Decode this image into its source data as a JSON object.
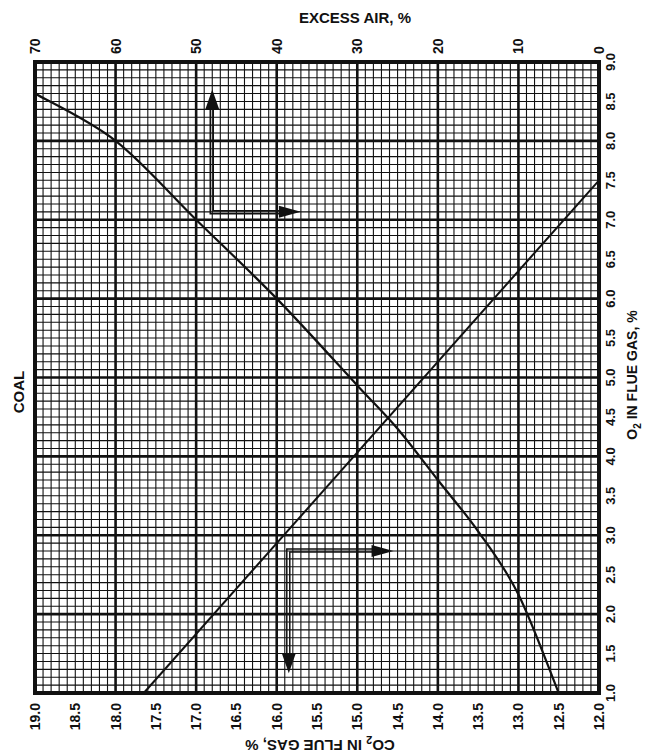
{
  "chart_data": {
    "type": "line",
    "title": "COAL",
    "subtitle": "",
    "fuel_label": "COAL",
    "x_bottom": {
      "label": "CO2 IN FLUE GAS, %",
      "label_parts": {
        "pre": "CO",
        "sub": "2",
        "post": " IN FLUE GAS, %"
      },
      "orientation": "upside-down",
      "range": [
        19.0,
        12.0
      ],
      "ticks": [
        "19.0",
        "18.5",
        "18.0",
        "17.5",
        "17.0",
        "16.5",
        "16.0",
        "15.5",
        "15.0",
        "14.5",
        "14.0",
        "13.5",
        "13.0",
        "12.5",
        "12.0"
      ]
    },
    "x_top": {
      "label": "EXCESS AIR, %",
      "range": [
        70,
        0
      ],
      "ticks": [
        "70",
        "60",
        "50",
        "40",
        "30",
        "20",
        "10",
        "0"
      ]
    },
    "y_right": {
      "label": "O2 IN FLUE GAS, %",
      "label_parts": {
        "pre": "O",
        "sub": "2",
        "post": " IN FLUE GAS, %"
      },
      "range": [
        1.0,
        9.0
      ],
      "ticks": [
        "1.0",
        "1.5",
        "2.0",
        "2.5",
        "3.0",
        "3.5",
        "4.0",
        "4.5",
        "5.0",
        "5.5",
        "6.0",
        "6.5",
        "7.0",
        "7.5",
        "8.0",
        "8.5",
        "9.0"
      ]
    },
    "grid": {
      "on": true,
      "minor_per_major": 10,
      "major_x_every": 1.0,
      "major_y_every": 1.0
    },
    "series": [
      {
        "name": "Excess air vs CO2 (curve)",
        "axis": "excess_air_vs_co2",
        "points_co2_o2scale": [
          {
            "co2": 19.0,
            "o2": 8.6
          },
          {
            "co2": 18.0,
            "o2": 8.0
          },
          {
            "co2": 17.0,
            "o2": 7.0
          },
          {
            "co2": 16.0,
            "o2": 6.0
          },
          {
            "co2": 15.0,
            "o2": 4.9
          },
          {
            "co2": 14.5,
            "o2": 4.35
          },
          {
            "co2": 14.0,
            "o2": 3.7
          },
          {
            "co2": 13.5,
            "o2": 3.05
          },
          {
            "co2": 13.0,
            "o2": 2.25
          },
          {
            "co2": 12.5,
            "o2": 1.0
          }
        ]
      },
      {
        "name": "O2 vs CO2 (straight line)",
        "axis": "o2_vs_co2",
        "points": [
          {
            "co2": 17.65,
            "o2": 1.0
          },
          {
            "co2": 12.0,
            "o2": 7.5
          }
        ]
      }
    ],
    "annotations": [
      {
        "type": "arrow-path",
        "desc": "upper example: from CO2 ~16.8 up to excess air, and right to O2 ~7.1",
        "from": {
          "co2": 16.8,
          "o2": 7.1
        },
        "to_up": {
          "o2": 8.65
        },
        "to_right": {
          "co2": 15.7
        }
      },
      {
        "type": "arrow-path",
        "desc": "lower example: from O2 ~2.8 down to CO2 ~15.85, and right along O2 ~2.8",
        "from": {
          "co2": 15.85,
          "o2": 2.8
        },
        "to_down": {
          "o2": 1.25
        },
        "to_right": {
          "co2": 14.55
        }
      }
    ],
    "legend": {
      "position": "none"
    }
  }
}
